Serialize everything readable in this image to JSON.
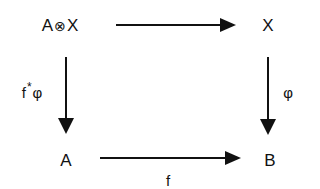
{
  "diagram": {
    "type": "commutative-square",
    "nodes": {
      "top_left": {
        "base": "A",
        "operator": "⊗",
        "right": "X"
      },
      "top_right": "X",
      "bottom_left": "A",
      "bottom_right": "B"
    },
    "arrows": {
      "top": {
        "from": "A⊗X",
        "to": "X",
        "label": ""
      },
      "left": {
        "from": "A⊗X",
        "to": "A",
        "label_base": "f",
        "label_sup": "*",
        "label_after": "φ"
      },
      "right": {
        "from": "X",
        "to": "B",
        "label": "φ"
      },
      "bottom": {
        "from": "A",
        "to": "B",
        "label": "f"
      }
    },
    "colors": {
      "ink": "#111111",
      "background": "#ffffff"
    }
  }
}
